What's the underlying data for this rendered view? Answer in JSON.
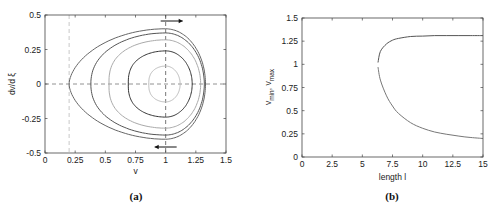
{
  "chart_data": [
    {
      "id": "a",
      "type": "line",
      "title": "",
      "caption": "(a)",
      "xlabel": "v",
      "ylabel": "dv/d ξ",
      "xlim": [
        0,
        1.5
      ],
      "ylim": [
        -0.5,
        0.5
      ],
      "xticks": [
        "0",
        "0.25",
        "0.5",
        "0.75",
        "1",
        "1.25",
        "1.5"
      ],
      "yticks": [
        "0.5",
        "0.25",
        "0",
        "-0.25",
        "-0.5"
      ],
      "grid": false,
      "reference_lines": [
        {
          "orientation": "vertical",
          "x": 0.2,
          "style": "dashed",
          "color": "#bbbbbb"
        },
        {
          "orientation": "vertical",
          "x": 1.0,
          "style": "dashed",
          "color": "#555555"
        },
        {
          "orientation": "horizontal",
          "y": 0.0,
          "style": "dashed",
          "color": "#777777"
        }
      ],
      "annotations": [
        {
          "type": "arrow",
          "direction": "right",
          "at": {
            "v": 1.05,
            "dv": 0.47
          }
        },
        {
          "type": "arrow",
          "direction": "left",
          "at": {
            "v": 1.0,
            "dv": -0.47
          }
        }
      ],
      "series": [
        {
          "name": "orbit-1 (homoclinic)",
          "v_min": 0.2,
          "v_max": 1.33,
          "dv_max": 0.4,
          "color": "#666666"
        },
        {
          "name": "orbit-2",
          "v_min": 0.38,
          "v_max": 1.32,
          "dv_max": 0.37,
          "color": "#555555"
        },
        {
          "name": "orbit-3",
          "v_min": 0.53,
          "v_max": 1.29,
          "dv_max": 0.32,
          "color": "#aaaaaa"
        },
        {
          "name": "orbit-4",
          "v_min": 0.69,
          "v_max": 1.22,
          "dv_max": 0.24,
          "color": "#333333"
        },
        {
          "name": "orbit-5",
          "v_min": 0.86,
          "v_max": 1.12,
          "dv_max": 0.13,
          "color": "#bbbbbb"
        }
      ]
    },
    {
      "id": "b",
      "type": "line",
      "title": "",
      "caption": "(b)",
      "xlabel": "length l",
      "ylabel": "v_min, v_max",
      "xlim": [
        0,
        15
      ],
      "ylim": [
        0,
        1.5
      ],
      "xticks": [
        "0",
        "2.5",
        "5",
        "7.5",
        "10",
        "12.5",
        "15"
      ],
      "yticks": [
        "1.5",
        "1.25",
        "1",
        "0.75",
        "0.5",
        "0.25",
        "0"
      ],
      "grid": false,
      "x": [
        6.3,
        6.5,
        7.0,
        7.5,
        8.0,
        9.0,
        10.0,
        11.0,
        12.0,
        13.0,
        14.0,
        15.0
      ],
      "series": [
        {
          "name": "v_max",
          "values": [
            1.02,
            1.14,
            1.22,
            1.26,
            1.28,
            1.3,
            1.305,
            1.31,
            1.31,
            1.31,
            1.31,
            1.31
          ],
          "color": "#555555"
        },
        {
          "name": "v_min",
          "values": [
            0.97,
            0.83,
            0.66,
            0.55,
            0.47,
            0.37,
            0.31,
            0.27,
            0.245,
            0.225,
            0.21,
            0.2
          ],
          "color": "#777777"
        }
      ]
    }
  ]
}
